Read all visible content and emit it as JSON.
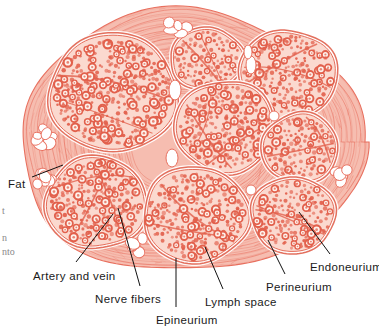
{
  "figure": {
    "colors": {
      "background": "#ffffff",
      "epineurium_fiber": "#e8705f",
      "epineurium_fill": "#f6bdb0",
      "perineurium": "#e0604d",
      "fascicle_fill": "#fbd9cf",
      "endoneurium_ring": "#e2604c",
      "axon_center": "#fdf2ec",
      "fat_fill": "#ffffff",
      "fat_outline": "#e8705f",
      "leader_line": "#111111",
      "label_text": "#1a1a1a"
    }
  },
  "labels": [
    {
      "id": "fat",
      "text": "Fat",
      "x": 8,
      "y": 178,
      "anchor": "start"
    },
    {
      "id": "artery-and-vein",
      "text": "Artery and vein",
      "x": 33,
      "y": 270,
      "anchor": "start"
    },
    {
      "id": "nerve-fibers",
      "text": "Nerve fibers",
      "x": 95,
      "y": 293,
      "anchor": "start"
    },
    {
      "id": "epineurium",
      "text": "Epineurium",
      "x": 156,
      "y": 314,
      "anchor": "start"
    },
    {
      "id": "lymph-space",
      "text": "Lymph space",
      "x": 205,
      "y": 296,
      "anchor": "start"
    },
    {
      "id": "perineurium",
      "text": "Perineurium",
      "x": 266,
      "y": 281,
      "anchor": "start"
    },
    {
      "id": "endoneurium",
      "text": "Endoneurium",
      "x": 310,
      "y": 261,
      "anchor": "start"
    }
  ],
  "leader_lines": [
    {
      "id": "fat",
      "x1": 32,
      "y1": 177,
      "x2": 63,
      "y2": 165
    },
    {
      "id": "artery-and-vein",
      "x1": 76,
      "y1": 262,
      "x2": 113,
      "y2": 214
    },
    {
      "id": "nerve-fibers",
      "x1": 140,
      "y1": 286,
      "x2": 118,
      "y2": 208
    },
    {
      "id": "epineurium",
      "x1": 176,
      "y1": 307,
      "x2": 176,
      "y2": 258
    },
    {
      "id": "lymph-space",
      "x1": 223,
      "y1": 289,
      "x2": 205,
      "y2": 247
    },
    {
      "id": "perineurium",
      "x1": 285,
      "y1": 274,
      "x2": 268,
      "y2": 240
    },
    {
      "id": "endoneurium",
      "x1": 330,
      "y1": 254,
      "x2": 299,
      "y2": 212
    }
  ],
  "page_fragments": [
    {
      "id": "frag-1",
      "text": "t",
      "x": 2,
      "y": 205
    },
    {
      "id": "frag-2",
      "text": "n",
      "x": 2,
      "y": 232
    },
    {
      "id": "frag-3",
      "text": "nto",
      "x": 2,
      "y": 246
    }
  ],
  "anatomy": {
    "outline": "nerve-trunk-outline",
    "fascicles": [
      {
        "id": "fascicle-1",
        "cx": 113,
        "cy": 93,
        "rx": 62,
        "ry": 57
      },
      {
        "id": "fascicle-2",
        "cx": 207,
        "cy": 59,
        "rx": 35,
        "ry": 29
      },
      {
        "id": "fascicle-3",
        "cx": 288,
        "cy": 75,
        "rx": 47,
        "ry": 43
      },
      {
        "id": "fascicle-4",
        "cx": 225,
        "cy": 127,
        "rx": 48,
        "ry": 44
      },
      {
        "id": "fascicle-5",
        "cx": 300,
        "cy": 148,
        "rx": 36,
        "ry": 33
      },
      {
        "id": "fascicle-6",
        "cx": 96,
        "cy": 203,
        "rx": 49,
        "ry": 44
      },
      {
        "id": "fascicle-7",
        "cx": 196,
        "cy": 215,
        "rx": 51,
        "ry": 46
      },
      {
        "id": "fascicle-8",
        "cx": 293,
        "cy": 215,
        "rx": 40,
        "ry": 36
      }
    ],
    "fat_clusters": [
      {
        "id": "fat-cluster-top",
        "cx": 176,
        "cy": 28
      },
      {
        "id": "fat-cluster-left-upper",
        "cx": 44,
        "cy": 137
      },
      {
        "id": "fat-cluster-left-lower",
        "cx": 45,
        "cy": 177
      },
      {
        "id": "fat-cluster-bottom",
        "cx": 134,
        "cy": 245
      },
      {
        "id": "fat-cluster-right",
        "cx": 341,
        "cy": 176
      }
    ],
    "vessels": [
      {
        "id": "vessel-lymph-upper",
        "cx": 175,
        "cy": 90,
        "rx": 6,
        "ry": 10
      },
      {
        "id": "vessel-lymph-mid",
        "cx": 172,
        "cy": 158,
        "rx": 6,
        "ry": 9
      },
      {
        "id": "vessel-right-a",
        "cx": 251,
        "cy": 65,
        "rx": 5,
        "ry": 9
      },
      {
        "id": "vessel-right-b",
        "cx": 248,
        "cy": 52,
        "rx": 4,
        "ry": 7
      },
      {
        "id": "vessel-right-c",
        "cx": 274,
        "cy": 116,
        "rx": 5,
        "ry": 5
      },
      {
        "id": "vessel-mid-low",
        "cx": 251,
        "cy": 190,
        "rx": 5,
        "ry": 5
      }
    ]
  }
}
